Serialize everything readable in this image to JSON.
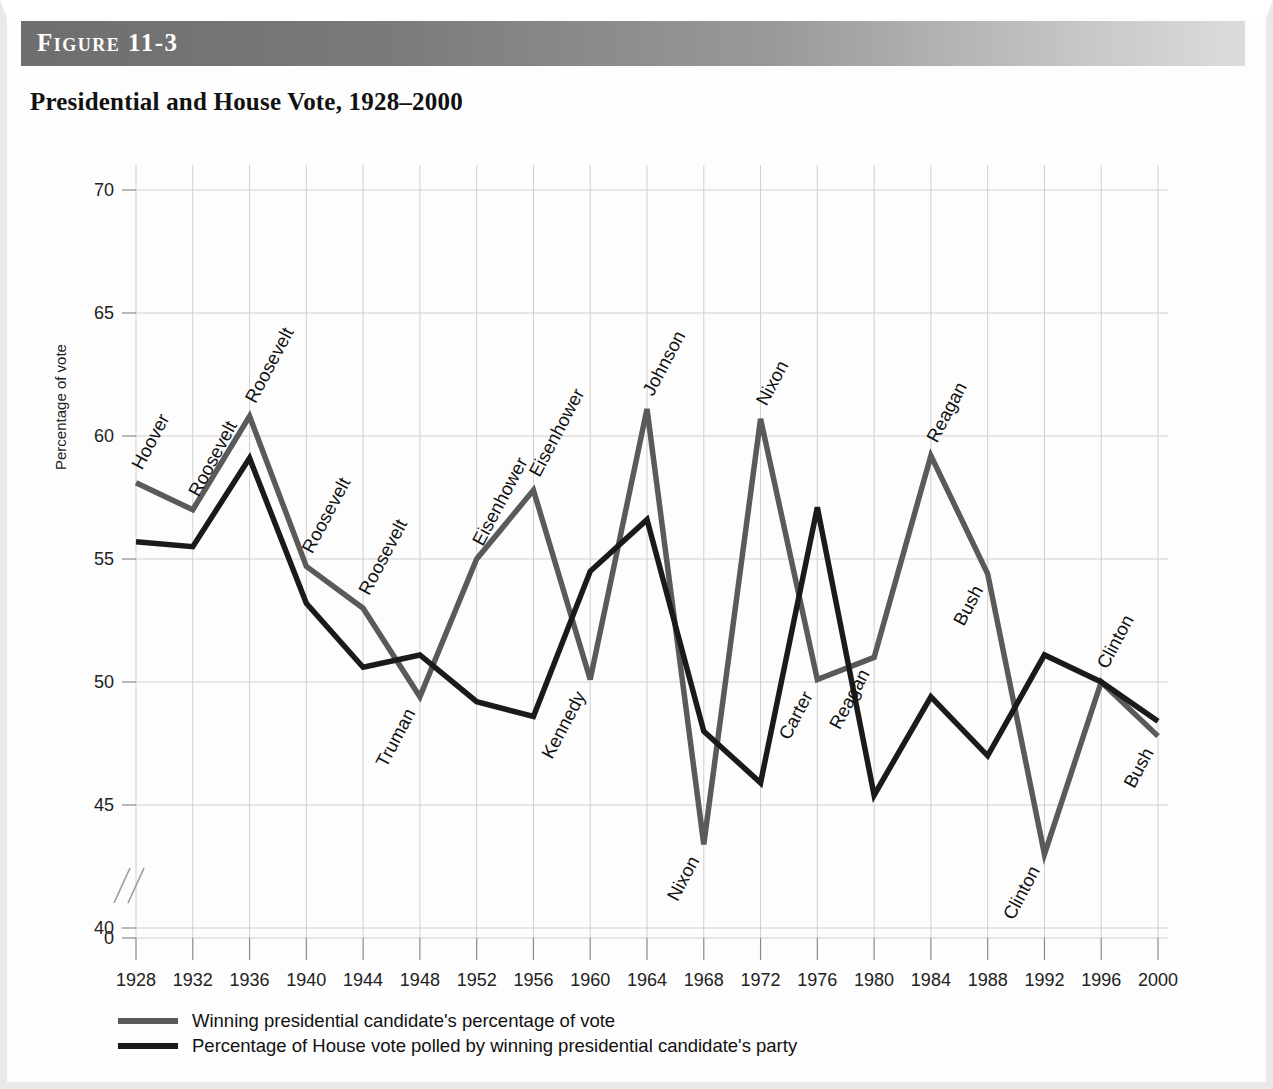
{
  "figure": {
    "number_label": "Figure 11-3",
    "title": "Presidential and House Vote, 1928–2000"
  },
  "axes": {
    "ylabel": "Percentage of vote",
    "y_ticks": [
      "0",
      "40",
      "45",
      "50",
      "55",
      "60",
      "65",
      "70"
    ],
    "x_ticks": [
      "1928",
      "1932",
      "1936",
      "1940",
      "1944",
      "1948",
      "1952",
      "1956",
      "1960",
      "1964",
      "1968",
      "1972",
      "1976",
      "1980",
      "1984",
      "1988",
      "1992",
      "1996",
      "2000"
    ],
    "axis_break": "double-slash-break"
  },
  "legend": {
    "position": "below-axis",
    "entries": [
      {
        "label": "Winning presidential candidate's percentage of vote",
        "color": "#5a5a5a",
        "swatch_name": "presidential-line-swatch"
      },
      {
        "label": "Percentage of House vote polled by winning presidential candidate's party",
        "color": "#1a1a1a",
        "swatch_name": "house-line-swatch"
      }
    ]
  },
  "colors": {
    "presidential_line": "#5a5a5a",
    "house_line": "#1a1a1a",
    "grid": "#cfcfcf",
    "header_bar_dark": "#6e6e6e",
    "header_bar_light": "#dcdcdc",
    "text": "#111111"
  },
  "chart_data": {
    "type": "line",
    "title": "Presidential and House Vote, 1928–2000",
    "xlabel": "",
    "ylabel": "Percentage of vote",
    "x": [
      1928,
      1932,
      1936,
      1940,
      1944,
      1948,
      1952,
      1956,
      1960,
      1964,
      1968,
      1972,
      1976,
      1980,
      1984,
      1988,
      1992,
      1996,
      2000
    ],
    "ylim": [
      40,
      70
    ],
    "y_ticks": [
      40,
      45,
      50,
      55,
      60,
      65,
      70
    ],
    "y_axis_break_below": 40,
    "y_axis_zero_shown": true,
    "grid": true,
    "legend_position": "bottom-left",
    "series": [
      {
        "name": "Winning presidential candidate's percentage of vote",
        "color": "#5a5a5a",
        "values": [
          58.1,
          57.0,
          60.8,
          54.7,
          53.0,
          49.4,
          55.0,
          57.8,
          50.1,
          61.1,
          43.4,
          60.7,
          50.1,
          51.0,
          59.2,
          54.4,
          43.0,
          50.0,
          47.8
        ]
      },
      {
        "name": "Percentage of House vote polled by winning presidential candidate's party",
        "color": "#1a1a1a",
        "values": [
          55.7,
          55.5,
          59.1,
          53.2,
          50.6,
          51.1,
          49.2,
          48.6,
          54.5,
          56.6,
          48.0,
          45.9,
          57.1,
          45.4,
          49.4,
          47.0,
          51.1,
          50.0,
          48.4
        ]
      }
    ],
    "annotations": [
      {
        "text": "Hoover",
        "x": 1928,
        "y": 58.1,
        "series": "presidential",
        "placement": "above-rotated"
      },
      {
        "text": "Roosevelt",
        "x": 1932,
        "y": 57.0,
        "series": "presidential",
        "placement": "above-rotated"
      },
      {
        "text": "Roosevelt",
        "x": 1936,
        "y": 60.8,
        "series": "presidential",
        "placement": "above-rotated"
      },
      {
        "text": "Roosevelt",
        "x": 1940,
        "y": 54.7,
        "series": "presidential",
        "placement": "above-rotated"
      },
      {
        "text": "Roosevelt",
        "x": 1944,
        "y": 53.0,
        "series": "presidential",
        "placement": "above-rotated"
      },
      {
        "text": "Truman",
        "x": 1948,
        "y": 49.4,
        "series": "presidential",
        "placement": "below-rotated"
      },
      {
        "text": "Eisenhower",
        "x": 1952,
        "y": 55.0,
        "series": "presidential",
        "placement": "above-rotated"
      },
      {
        "text": "Eisenhower",
        "x": 1956,
        "y": 57.8,
        "series": "presidential",
        "placement": "above-rotated"
      },
      {
        "text": "Kennedy",
        "x": 1960,
        "y": 50.1,
        "series": "presidential",
        "placement": "below-rotated"
      },
      {
        "text": "Johnson",
        "x": 1964,
        "y": 61.1,
        "series": "presidential",
        "placement": "above-rotated"
      },
      {
        "text": "Nixon",
        "x": 1968,
        "y": 43.4,
        "series": "presidential",
        "placement": "below-rotated"
      },
      {
        "text": "Nixon",
        "x": 1972,
        "y": 60.7,
        "series": "presidential",
        "placement": "above-rotated"
      },
      {
        "text": "Carter",
        "x": 1976,
        "y": 50.1,
        "series": "presidential",
        "placement": "below-rotated"
      },
      {
        "text": "Reagan",
        "x": 1980,
        "y": 51.0,
        "series": "presidential",
        "placement": "below-rotated"
      },
      {
        "text": "Reagan",
        "x": 1984,
        "y": 59.2,
        "series": "presidential",
        "placement": "above-rotated"
      },
      {
        "text": "Bush",
        "x": 1988,
        "y": 54.4,
        "series": "presidential",
        "placement": "below-rotated"
      },
      {
        "text": "Clinton",
        "x": 1992,
        "y": 43.0,
        "series": "presidential",
        "placement": "below-rotated"
      },
      {
        "text": "Clinton",
        "x": 1996,
        "y": 50.0,
        "series": "presidential",
        "placement": "above-rotated"
      },
      {
        "text": "Bush",
        "x": 2000,
        "y": 47.8,
        "series": "presidential",
        "placement": "below-rotated"
      }
    ]
  }
}
